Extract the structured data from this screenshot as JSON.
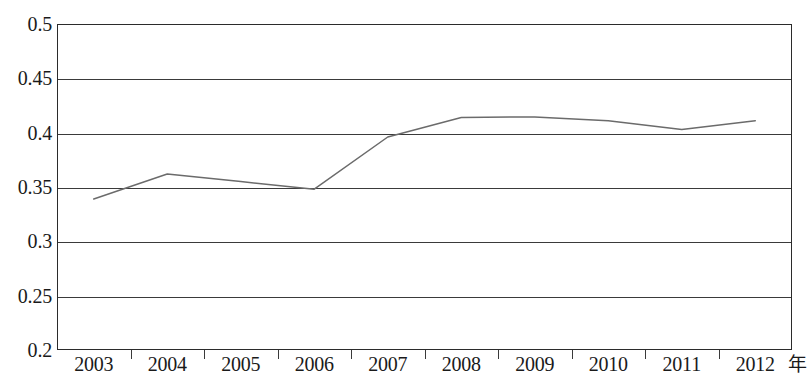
{
  "chart_data": {
    "type": "line",
    "title": "",
    "subtitle": "",
    "xlabel": "年",
    "ylabel": "",
    "grid": true,
    "legend": false,
    "legend_position": "none",
    "categories": [
      "2003",
      "2004",
      "2005",
      "2006",
      "2007",
      "2008",
      "2009",
      "2010",
      "2011",
      "2012"
    ],
    "x": [
      2003,
      2004,
      2005,
      2006,
      2007,
      2008,
      2009,
      2010,
      2011,
      2012
    ],
    "xlim": [
      2003,
      2012
    ],
    "ylim": [
      0.2,
      0.5
    ],
    "yticks": [
      0.2,
      0.25,
      0.3,
      0.35,
      0.4,
      0.45,
      0.5
    ],
    "ytick_labels": [
      "0.2",
      "0.25",
      "0.3",
      "0.35",
      "0.4",
      "0.45",
      "0.5"
    ],
    "series": [
      {
        "name": "series-1",
        "color": "#6b6b6b",
        "values": [
          0.339,
          0.362,
          0.355,
          0.348,
          0.396,
          0.414,
          0.4145,
          0.411,
          0.403,
          0.411
        ]
      }
    ]
  },
  "axes": {
    "y_ticks": [
      {
        "label": "0.5",
        "value": 0.5
      },
      {
        "label": "0.45",
        "value": 0.45
      },
      {
        "label": "0.4",
        "value": 0.4
      },
      {
        "label": "0.35",
        "value": 0.35
      },
      {
        "label": "0.3",
        "value": 0.3
      },
      {
        "label": "0.25",
        "value": 0.25
      },
      {
        "label": "0.2",
        "value": 0.2
      }
    ],
    "x_ticks": [
      {
        "label": "2003"
      },
      {
        "label": "2004"
      },
      {
        "label": "2005"
      },
      {
        "label": "2006"
      },
      {
        "label": "2007"
      },
      {
        "label": "2008"
      },
      {
        "label": "2009"
      },
      {
        "label": "2010"
      },
      {
        "label": "2011"
      },
      {
        "label": "2012"
      }
    ],
    "x_unit_label": "年"
  },
  "style": {
    "line_color": "#6b6b6b",
    "axis_color": "#2b2b2b",
    "grid_color": "#3a3a3a",
    "text_color": "#1a1a1a",
    "background": "#ffffff"
  }
}
